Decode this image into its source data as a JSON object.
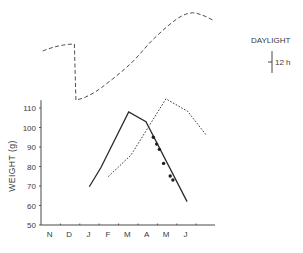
{
  "chart_data": {
    "type": "line",
    "title": "",
    "xlabel": "",
    "ylabel": "WEIGHT (g)",
    "ylim": [
      50,
      115
    ],
    "yticks": [
      50,
      60,
      70,
      80,
      90,
      100,
      110
    ],
    "xtick_labels": [
      "N",
      "D",
      "J",
      "F",
      "M",
      "A",
      "M",
      "J"
    ],
    "x_units": "months from start of November",
    "grid": false,
    "series": [
      {
        "name": "weight-solid",
        "style": "solid",
        "points": [
          [
            2.49,
            69.6
          ],
          [
            3.09,
            79.5
          ],
          [
            4.52,
            108
          ],
          [
            5.41,
            103
          ],
          [
            7.53,
            62
          ]
        ],
        "markers": [
          [
            5.79,
            95
          ],
          [
            5.96,
            91.5
          ],
          [
            6.1,
            88.8
          ],
          [
            6.32,
            81.6
          ],
          [
            6.66,
            75.1
          ],
          [
            6.8,
            73.1
          ]
        ]
      },
      {
        "name": "weight-dotted",
        "style": "dotted",
        "points": [
          [
            3.47,
            74.8
          ],
          [
            4.64,
            85.9
          ],
          [
            6.44,
            114.7
          ],
          [
            7.56,
            108.3
          ],
          [
            8.51,
            96.2
          ]
        ]
      },
      {
        "name": "daylight",
        "style": "dashed",
        "units": "relative daylight level",
        "points": [
          [
            0.09,
            51
          ],
          [
            0.9,
            55.5
          ],
          [
            1.72,
            58
          ],
          [
            1.8,
            2
          ],
          [
            2.3,
            5
          ],
          [
            3.09,
            14
          ],
          [
            4.6,
            38
          ],
          [
            5.8,
            63
          ],
          [
            7.0,
            83
          ],
          [
            7.73,
            89
          ],
          [
            8.3,
            87
          ],
          [
            8.85,
            82
          ]
        ]
      }
    ],
    "legend": {
      "label": "DAYLIGHT",
      "scale_label": "12 h"
    }
  }
}
